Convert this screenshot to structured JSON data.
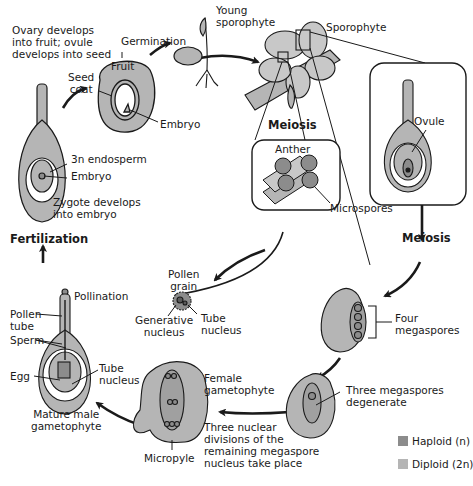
{
  "diagram": {
    "colors": {
      "haploid": "#8c8c8c",
      "diploid": "#b5b5b5",
      "outline": "#1a1a1a",
      "background": "#ffffff"
    },
    "labels": {
      "ovary_develops": [
        "Ovary develops",
        "into fruit; ovule",
        "develops into seed"
      ],
      "germination": "Germination",
      "young_sporophyte": [
        "Young",
        "sporophyte"
      ],
      "sporophyte": "Sporophyte",
      "fruit": "Fruit",
      "seed_coat": [
        "Seed",
        "coat"
      ],
      "embryo_seed": "Embryo",
      "endosperm": "3n endosperm",
      "embryo": "Embryo",
      "zygote": [
        "Zygote develops",
        "into embryo"
      ],
      "fertilization": "Fertilization",
      "meiosis_anther": "Meiosis",
      "anther": "Anther",
      "microspores": "Microspores",
      "ovule": "Ovule",
      "meiosis_ovule": "Meiosis",
      "pollen_grain": [
        "Pollen",
        "grain"
      ],
      "generative_nucleus": [
        "Generative",
        "nucleus"
      ],
      "tube_nucleus_pollen": [
        "Tube",
        "nucleus"
      ],
      "pollination": "Pollination",
      "pollen_tube": [
        "Pollen",
        "tube"
      ],
      "sperm": "Sperm",
      "egg": "Egg",
      "tube_nucleus": [
        "Tube",
        "nucleus"
      ],
      "mature_male": [
        "Mature male",
        "gametophyte"
      ],
      "four_megaspores": [
        "Four",
        "megaspores"
      ],
      "three_degenerate": [
        "Three megaspores",
        "degenerate"
      ],
      "female_gametophyte": [
        "Female",
        "gametophyte"
      ],
      "three_nuclear": [
        "Three nuclear",
        "divisions of the",
        "remaining megaspore",
        "nucleus take place"
      ],
      "micropyle": "Micropyle"
    },
    "legend": [
      {
        "label": "Haploid (n)",
        "color": "#8c8c8c"
      },
      {
        "label": "Diploid (2n)",
        "color": "#b5b5b5"
      }
    ]
  }
}
